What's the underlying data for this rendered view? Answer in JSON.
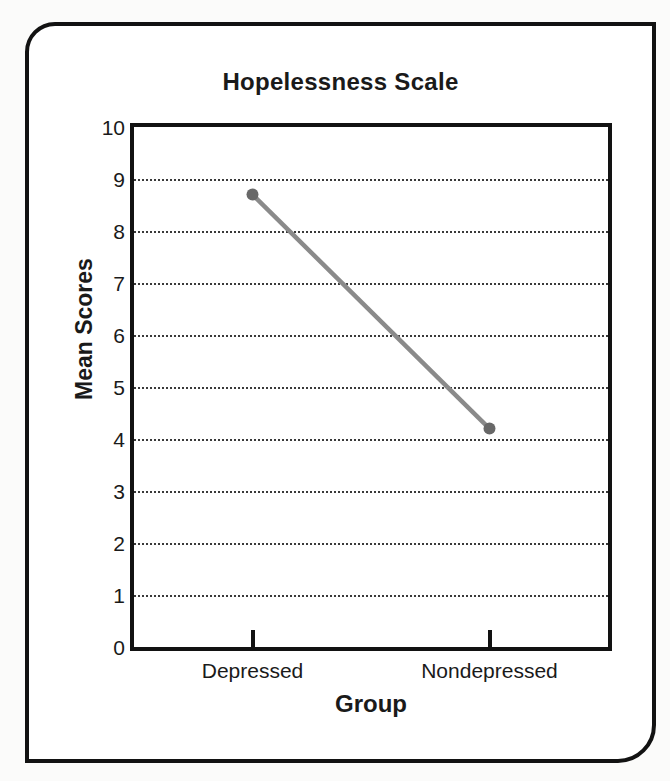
{
  "chart_data": {
    "type": "line",
    "title": "Hopelessness Scale",
    "xlabel": "Group",
    "ylabel": "Mean Scores",
    "categories": [
      "Depressed",
      "Nondepressed"
    ],
    "values": [
      8.7,
      4.2
    ],
    "ylim": [
      0,
      10
    ],
    "yticks": [
      0,
      1,
      2,
      3,
      4,
      5,
      6,
      7,
      8,
      9,
      10
    ],
    "grid": "horizontal-dotted-at-1-through-9",
    "legend": "none",
    "colors": {
      "line": "#8a8a8a",
      "marker": "#686868",
      "axis": "#121212",
      "gridline": "#3a3a3a",
      "text": "#1a1a1a"
    }
  }
}
